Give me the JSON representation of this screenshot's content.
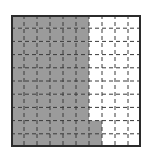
{
  "diagram": {
    "type": "hundred-grid",
    "rows": 10,
    "cols": 10,
    "shaded_count": 62,
    "total_cells": 100,
    "shading": {
      "full_columns": 6,
      "partial_column_index": 7,
      "partial_column_shaded_rows": [
        9,
        10
      ]
    },
    "colors": {
      "shaded": "#9b9b9b",
      "unshaded": "#ffffff",
      "border": "#2b2b2b",
      "gridline": "#3a3a3a"
    }
  }
}
